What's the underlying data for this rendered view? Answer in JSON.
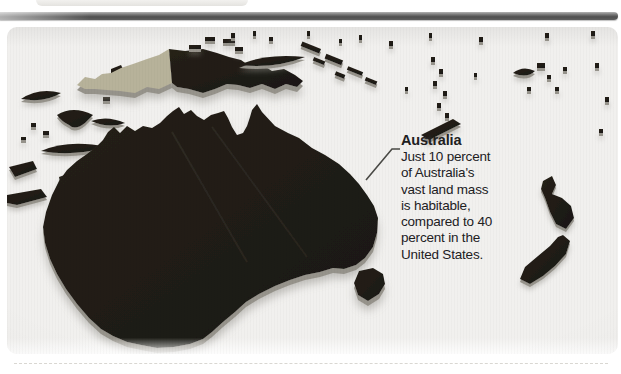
{
  "annotation": {
    "title": "Australia",
    "body_lines": [
      "Just 10 percent",
      "of Australia's",
      "vast land mass",
      "is habitable,",
      "compared to 40",
      "percent in the",
      "United States."
    ]
  },
  "colors": {
    "land": "#1a1712",
    "land_highlight": "#262118",
    "lowland_tan": "#b7b29a",
    "extrusion_wall": "#96938b",
    "shadow": "#8c8a84",
    "panel_background": "#f1f0ee",
    "rule_bar": "#5e5e5e",
    "text": "#21201e"
  },
  "map": {
    "type": "3d-extruded-relief-map",
    "regions": [
      "australia",
      "tasmania",
      "new-guinea",
      "indonesian-archipelago",
      "bismarck-islands",
      "solomon-islands",
      "vanuatu",
      "new-caledonia",
      "fiji",
      "new-zealand",
      "pacific-islets"
    ]
  }
}
